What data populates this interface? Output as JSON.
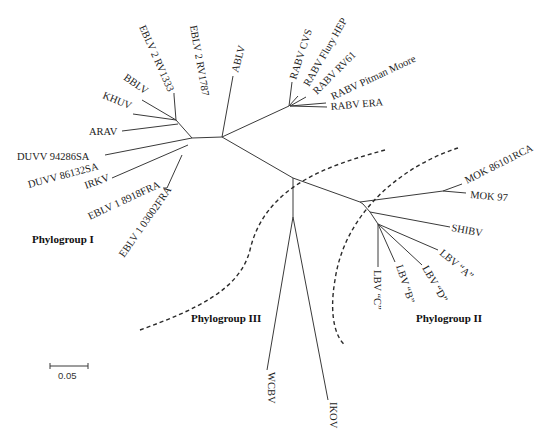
{
  "diagram": {
    "type": "unrooted phylogenetic tree",
    "taxa": {
      "ebl2_1333": "EBLV 2 RV1333",
      "ebl2_1787": "EBLV 2 RV1787",
      "bblv": "BBLV",
      "khuv": "KHUV",
      "arav": "ARAV",
      "duvv1": "DUVV 94286SA",
      "duvv2": "DUVV 86132SA",
      "irkv": "IRKV",
      "ebl1_8918": "EBLV 1 8918FRA",
      "ebl1_03002": "EBLV 1 03002FRA",
      "ablv": "ABLV",
      "rabv_cvs": "RABV CVS",
      "rabv_flury": "RABV Flury HEP",
      "rabv_rv61": "RABV RV61",
      "rabv_pm": "RABV Pitman Moore",
      "rabv_era": "RABV ERA",
      "mok1": "MOK 86101RCA",
      "mok2": "MOK 97",
      "shibv": "SHIBV",
      "lbva": "LBV “A”",
      "lbvd": "LBV “D”",
      "lbvb": "LBV “B”",
      "lbvc": "LBV “C”",
      "wcbv": "WCBV",
      "ikov": "IKOV"
    },
    "groups": {
      "g1": "Phylogroup I",
      "g2": "Phylogroup II",
      "g3": "Phylogroup III"
    },
    "scale_bar": {
      "label": "0.05"
    },
    "caption_fragment": "Fig. ... Tree of lyssaviruses ..."
  }
}
